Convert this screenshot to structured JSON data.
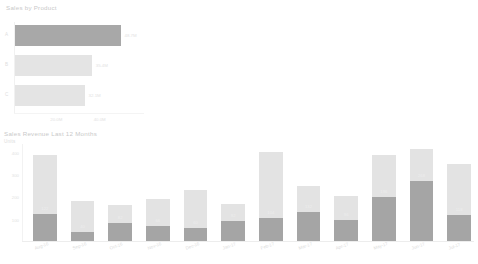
{
  "chart_data": [
    {
      "type": "bar",
      "orientation": "horizontal",
      "title": "Sales by Product",
      "xlabel": "",
      "ylabel": "",
      "categories": [
        "A",
        "B",
        "C"
      ],
      "values": [
        48.7,
        35.4,
        32.1
      ],
      "value_labels": [
        "48.7M",
        "35.4M",
        "32.1M"
      ],
      "xlim": [
        0,
        60
      ],
      "xticks": [
        "20.0M",
        "40.0M"
      ],
      "grid": false,
      "colors": [
        "#a8a8a8",
        "#e4e4e4",
        "#e4e4e4"
      ],
      "highlight_index": 0
    },
    {
      "type": "bar",
      "stacked": true,
      "orientation": "vertical",
      "title": "Sales Revenue Last 12 Months",
      "subtitle": "Units",
      "xlabel": "",
      "ylabel": "",
      "categories": [
        "Aug-16",
        "Sep-16",
        "Oct-16",
        "Nov-16",
        "Dec-16",
        "Jan-17",
        "Feb-17",
        "Mar-17",
        "Apr-17",
        "May-17",
        "Jun-17",
        "Jul-17"
      ],
      "yticks": [
        "100",
        "200",
        "300",
        "400"
      ],
      "ylim": [
        0,
        440
      ],
      "grid": false,
      "series": [
        {
          "name": "Lower",
          "color": "#a5a5a5",
          "values": [
            122,
            40,
            82,
            66,
            60,
            92,
            104,
            132,
            96,
            196,
            268,
            118
          ]
        },
        {
          "name": "Upper",
          "color": "#e3e3e3",
          "values": [
            266,
            140,
            78,
            122,
            168,
            72,
            294,
            114,
            108,
            190,
            144,
            228
          ]
        }
      ],
      "totals": [
        388,
        180,
        160,
        188,
        228,
        164,
        398,
        246,
        204,
        386,
        412,
        346
      ]
    }
  ],
  "panel_product": {
    "title": "Sales by Product",
    "rows": [
      {
        "label": "A",
        "value_label": "48.7M"
      },
      {
        "label": "B",
        "value_label": "35.4M"
      },
      {
        "label": "C",
        "value_label": "32.1M"
      }
    ],
    "xticks": [
      {
        "label": "20.0M"
      },
      {
        "label": "40.0M"
      }
    ]
  },
  "panel_revenue": {
    "title": "Sales Revenue Last 12 Months",
    "subtitle": "Units",
    "yticks": [
      {
        "label": "400"
      },
      {
        "label": "300"
      },
      {
        "label": "200"
      },
      {
        "label": "100"
      }
    ],
    "columns": [
      {
        "month": "Aug-16",
        "lower_label": "122",
        "upper_label": "266"
      },
      {
        "month": "Sep-16",
        "lower_label": "40",
        "upper_label": "140"
      },
      {
        "month": "Oct-16",
        "lower_label": "82",
        "upper_label": "78"
      },
      {
        "month": "Nov-16",
        "lower_label": "66",
        "upper_label": "122"
      },
      {
        "month": "Dec-16",
        "lower_label": "60",
        "upper_label": "168"
      },
      {
        "month": "Jan-17",
        "lower_label": "92",
        "upper_label": "72"
      },
      {
        "month": "Feb-17",
        "lower_label": "104",
        "upper_label": "294"
      },
      {
        "month": "Mar-17",
        "lower_label": "132",
        "upper_label": "114"
      },
      {
        "month": "Apr-17",
        "lower_label": "96",
        "upper_label": "108"
      },
      {
        "month": "May-17",
        "lower_label": "196",
        "upper_label": "190"
      },
      {
        "month": "Jun-17",
        "lower_label": "268",
        "upper_label": "144"
      },
      {
        "month": "Jul-17",
        "lower_label": "118",
        "upper_label": "228"
      }
    ]
  }
}
